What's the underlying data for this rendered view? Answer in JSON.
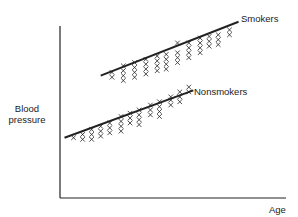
{
  "chart_data": {
    "type": "scatter",
    "title": "",
    "xlabel": "Age",
    "ylabel": "Blood pressure",
    "xlim": [
      0,
      100
    ],
    "ylim": [
      0,
      100
    ],
    "grid": false,
    "ticks": false,
    "legend_position": "inline labels at end of regression lines",
    "series": [
      {
        "name": "Smokers",
        "label": "Smokers",
        "trend_line": {
          "x0": 18,
          "y0": 70,
          "x1": 79,
          "y1": 103
        },
        "points": [
          [
            23,
            69
          ],
          [
            23,
            72
          ],
          [
            28,
            70
          ],
          [
            28,
            73
          ],
          [
            28,
            76
          ],
          [
            28,
            67
          ],
          [
            33,
            72
          ],
          [
            33,
            75
          ],
          [
            33,
            78
          ],
          [
            33,
            69
          ],
          [
            38,
            74
          ],
          [
            38,
            77
          ],
          [
            38,
            80
          ],
          [
            38,
            71
          ],
          [
            43,
            76
          ],
          [
            43,
            79
          ],
          [
            43,
            82
          ],
          [
            43,
            73
          ],
          [
            47,
            80
          ],
          [
            47,
            74
          ],
          [
            47,
            77
          ],
          [
            47,
            83
          ],
          [
            52,
            84
          ],
          [
            52,
            81
          ],
          [
            52,
            78
          ],
          [
            52,
            90
          ],
          [
            57,
            84
          ],
          [
            57,
            87
          ],
          [
            57,
            90
          ],
          [
            57,
            81
          ],
          [
            62,
            87
          ],
          [
            62,
            90
          ],
          [
            62,
            84
          ],
          [
            62,
            93
          ],
          [
            66,
            91
          ],
          [
            66,
            88
          ],
          [
            66,
            94
          ],
          [
            70,
            92
          ],
          [
            70,
            95
          ],
          [
            70,
            89
          ],
          [
            75,
            95
          ],
          [
            75,
            98
          ]
        ]
      },
      {
        "name": "Nonsmokers",
        "label": "Nonsmokers",
        "trend_line": {
          "x0": 2,
          "y0": 32,
          "x1": 59,
          "y1": 61
        },
        "points": [
          [
            6,
            32
          ],
          [
            10,
            34
          ],
          [
            10,
            31
          ],
          [
            14,
            37
          ],
          [
            14,
            34
          ],
          [
            14,
            31
          ],
          [
            18,
            39
          ],
          [
            18,
            36
          ],
          [
            18,
            33
          ],
          [
            22,
            41
          ],
          [
            22,
            38
          ],
          [
            22,
            35
          ],
          [
            27,
            45
          ],
          [
            27,
            42
          ],
          [
            27,
            39
          ],
          [
            27,
            36
          ],
          [
            31,
            47
          ],
          [
            31,
            44
          ],
          [
            31,
            41
          ],
          [
            35,
            49
          ],
          [
            35,
            46
          ],
          [
            35,
            43
          ],
          [
            35,
            40
          ],
          [
            40,
            52
          ],
          [
            40,
            49
          ],
          [
            40,
            46
          ],
          [
            44,
            54
          ],
          [
            44,
            51
          ],
          [
            44,
            48
          ],
          [
            44,
            45
          ],
          [
            49,
            55
          ],
          [
            49,
            52
          ],
          [
            49,
            57
          ],
          [
            53,
            57
          ],
          [
            53,
            54
          ],
          [
            53,
            60
          ],
          [
            57,
            60
          ],
          [
            57,
            63
          ]
        ]
      }
    ]
  },
  "labels": {
    "y_axis": "Blood pressure",
    "x_axis": "Age",
    "smokers": "Smokers",
    "nonsmokers": "Nonsmokers"
  },
  "colors": {
    "ink": "#222222",
    "background": "#ffffff"
  }
}
